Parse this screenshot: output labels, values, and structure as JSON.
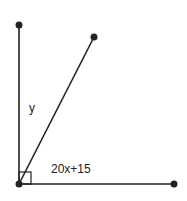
{
  "diagram": {
    "type": "angle-diagram",
    "labels": {
      "angle_upper": "y",
      "angle_lower": "20x+15"
    },
    "right_angle_marker": true,
    "colors": {
      "line": "#222222",
      "point": "#222222",
      "background": "#ffffff"
    }
  }
}
